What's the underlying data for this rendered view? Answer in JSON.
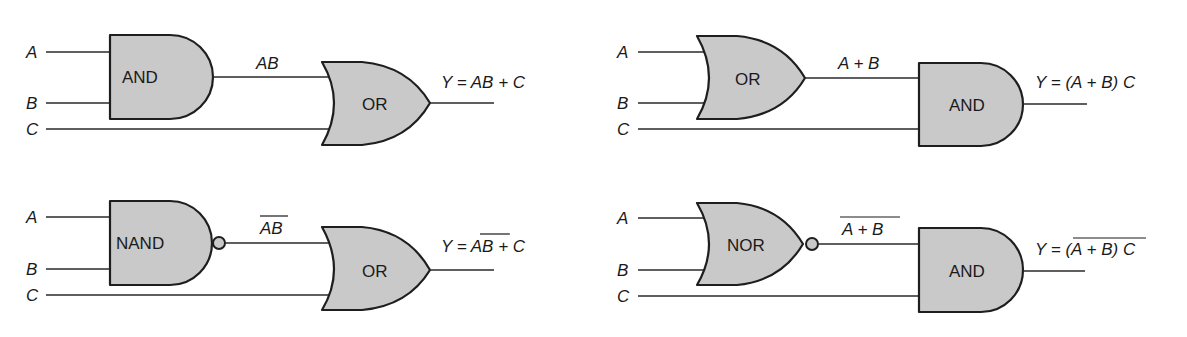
{
  "diagram": {
    "circuits": [
      {
        "id": "top-left",
        "inputs": [
          "A",
          "B",
          "C"
        ],
        "gate1": {
          "type": "AND",
          "label": "AND",
          "inverted": false
        },
        "intermediate": {
          "text": "AB",
          "overbar": false
        },
        "gate2": {
          "type": "OR",
          "label": "OR"
        },
        "output": {
          "prefix": "Y = ",
          "term": "AB",
          "term_overbar": false,
          "suffix": " + C"
        }
      },
      {
        "id": "top-right",
        "inputs": [
          "A",
          "B",
          "C"
        ],
        "gate1": {
          "type": "OR",
          "label": "OR",
          "inverted": false
        },
        "intermediate": {
          "text": "A + B",
          "overbar": false
        },
        "gate2": {
          "type": "AND",
          "label": "AND"
        },
        "output": {
          "prefix": "Y = ",
          "term": "(A + B)",
          "term_overbar": false,
          "suffix": " C"
        }
      },
      {
        "id": "bottom-left",
        "inputs": [
          "A",
          "B",
          "C"
        ],
        "gate1": {
          "type": "NAND",
          "label": "NAND",
          "inverted": true
        },
        "intermediate": {
          "text": "AB",
          "overbar": true
        },
        "gate2": {
          "type": "OR",
          "label": "OR"
        },
        "output": {
          "prefix": "Y = ",
          "term": "AB",
          "term_overbar": true,
          "suffix": " + C"
        }
      },
      {
        "id": "bottom-right",
        "inputs": [
          "A",
          "B",
          "C"
        ],
        "gate1": {
          "type": "NOR",
          "label": "NOR",
          "inverted": true
        },
        "intermediate": {
          "text": "A + B",
          "overbar": true
        },
        "gate2": {
          "type": "AND",
          "label": "AND"
        },
        "output": {
          "prefix": "Y = ",
          "term": "(A + B)",
          "term_overbar": true,
          "suffix": " C"
        }
      }
    ],
    "colors": {
      "gate_fill": "#c9c9c9",
      "stroke": "#1e1e1e",
      "background": "#ffffff"
    }
  }
}
